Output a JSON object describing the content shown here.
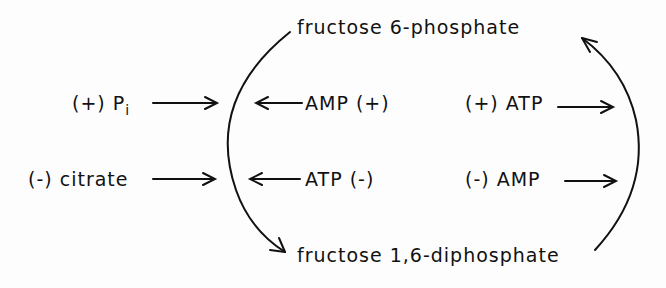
{
  "diagram": {
    "top_metabolite": "fructose 6-phosphate",
    "bottom_metabolite": "fructose 1,6-diphosphate",
    "left_effectors": [
      {
        "sign": "(+)",
        "name": "P",
        "subscript": "i"
      },
      {
        "sign": "(-)",
        "name": "citrate"
      }
    ],
    "forward_reaction_effectors": [
      {
        "label": "AMP (+)"
      },
      {
        "label": "ATP (-)"
      }
    ],
    "reverse_reaction_effectors": [
      {
        "label": "(+) ATP"
      },
      {
        "label": "(-) AMP"
      }
    ],
    "colors": {
      "ink": "#111111",
      "background": "#fdfdfd"
    }
  }
}
